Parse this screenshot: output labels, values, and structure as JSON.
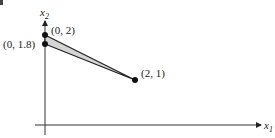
{
  "figure": {
    "corner_fragment": "b",
    "axes": {
      "x_label": "x",
      "x_sub": "1",
      "y_label": "x",
      "y_sub": "2"
    },
    "points": [
      {
        "label": "(0, 2)",
        "x": 0,
        "y": 2
      },
      {
        "label": "(0, 1.8)",
        "x": 0,
        "y": 1.8
      },
      {
        "label": "(2, 1)",
        "x": 2,
        "y": 1
      }
    ],
    "region": {
      "description": "shaded triangle with vertices (0, 2), (0, 1.8), (2, 1)",
      "fill": "#d4d4d4",
      "stroke": "#222222"
    }
  }
}
